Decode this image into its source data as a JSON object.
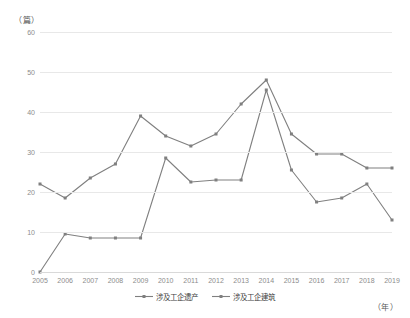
{
  "axis": {
    "unit_top": "（篇）",
    "unit_bottom": "（年）"
  },
  "legend": [
    {
      "label": "涉及工企遗产",
      "color": "#7f7f7f"
    },
    {
      "label": "涉及工企建筑",
      "color": "#808080"
    }
  ],
  "chart_data": {
    "type": "line",
    "title": "",
    "xlabel": "（年）",
    "ylabel": "（篇）",
    "ylim": [
      0,
      60
    ],
    "yticks": [
      0,
      10,
      20,
      30,
      40,
      50,
      60
    ],
    "grid": true,
    "legend_position": "bottom-center",
    "categories": [
      "2005",
      "2006",
      "2007",
      "2008",
      "2009",
      "2010",
      "2011",
      "2012",
      "2013",
      "2014",
      "2015",
      "2016",
      "2017",
      "2018",
      "2019"
    ],
    "series": [
      {
        "name": "涉及工企遗产",
        "color": "#7f7f7f",
        "marker": "square",
        "values": [
          22,
          18.5,
          23.5,
          27,
          39,
          34,
          31.5,
          34.5,
          42,
          48,
          34.5,
          29.5,
          29.5,
          26,
          26
        ]
      },
      {
        "name": "涉及工企建筑",
        "color": "#808080",
        "marker": "square",
        "values": [
          0,
          9.5,
          8.5,
          8.5,
          8.5,
          28.5,
          22.5,
          23,
          23,
          45.5,
          25.5,
          17.5,
          18.5,
          22,
          13
        ]
      }
    ]
  }
}
